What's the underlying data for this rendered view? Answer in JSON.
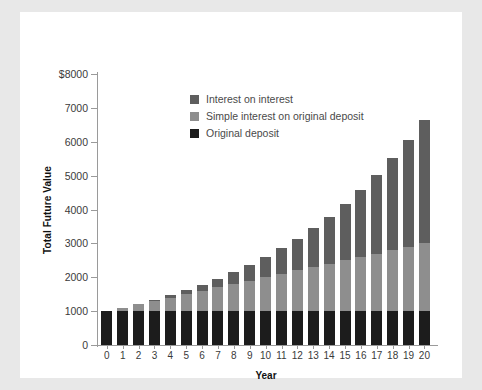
{
  "chart_data": {
    "type": "bar",
    "stacked": true,
    "title": "",
    "xlabel": "Year",
    "ylabel": "Total Future Value",
    "ylim": [
      0,
      8000
    ],
    "yticks": [
      0,
      1000,
      2000,
      3000,
      4000,
      5000,
      6000,
      7000,
      8000
    ],
    "ytick_labels": [
      "0",
      "1000",
      "2000",
      "3000",
      "4000",
      "5000",
      "6000",
      "7000",
      "$8000"
    ],
    "grid": false,
    "legend_position": "upper-left-inside",
    "categories": [
      "0",
      "1",
      "2",
      "3",
      "4",
      "5",
      "6",
      "7",
      "8",
      "9",
      "10",
      "11",
      "12",
      "13",
      "14",
      "15",
      "16",
      "17",
      "18",
      "19",
      "20"
    ],
    "series": [
      {
        "name": "Original deposit",
        "color": "#1c1c1c",
        "values": [
          1000,
          1000,
          1000,
          1000,
          1000,
          1000,
          1000,
          1000,
          1000,
          1000,
          1000,
          1000,
          1000,
          1000,
          1000,
          1000,
          1000,
          1000,
          1000,
          1000,
          1000
        ]
      },
      {
        "name": "Simple interest on original deposit",
        "color": "#8e8e8e",
        "values": [
          0,
          100,
          200,
          300,
          400,
          500,
          600,
          700,
          800,
          900,
          1000,
          1100,
          1200,
          1300,
          1400,
          1500,
          1600,
          1700,
          1800,
          1900,
          2000
        ]
      },
      {
        "name": "Interest on interest",
        "color": "#5e5e5e",
        "values": [
          0,
          0,
          10,
          31,
          64,
          111,
          172,
          249,
          344,
          458,
          594,
          753,
          937,
          1150,
          1392,
          1668,
          1979,
          2329,
          2720,
          3157,
          3641
        ]
      }
    ],
    "totals": [
      1000,
      1100,
      1210,
      1331,
      1464,
      1611,
      1772,
      1949,
      2144,
      2358,
      2594,
      2853,
      3138,
      3452,
      3797,
      4177,
      4595,
      5054,
      5560,
      6116,
      6727
    ]
  },
  "legend": {
    "items": [
      {
        "label": "Interest on interest",
        "key": "compound"
      },
      {
        "label": "Simple interest on original deposit",
        "key": "simple"
      },
      {
        "label": "Original deposit",
        "key": "deposit"
      }
    ]
  },
  "colors": {
    "page_background": "#e8e8e8",
    "card_background": "#ffffff",
    "axis": "#9a9a9a",
    "deposit": "#1c1c1c",
    "simple": "#8e8e8e",
    "compound": "#5e5e5e"
  }
}
